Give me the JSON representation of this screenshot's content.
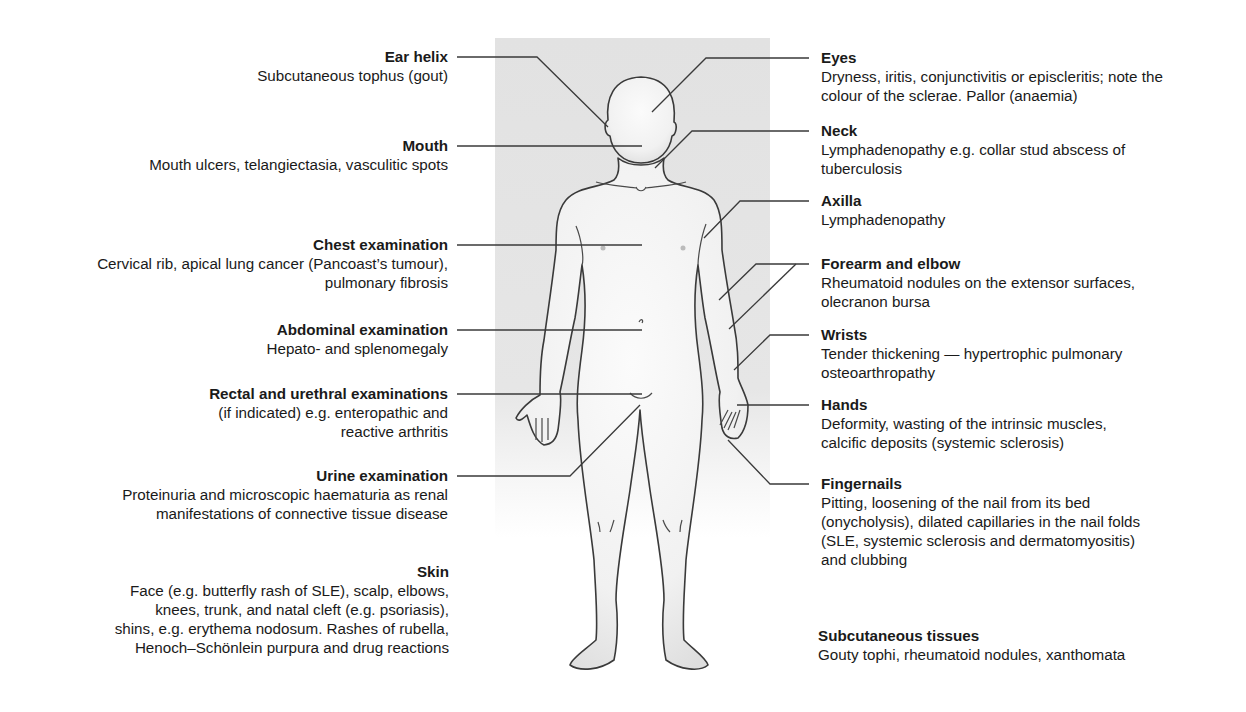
{
  "figure": {
    "background_panel_color": "#e4e4e4",
    "line_color": "#3a3a3a",
    "body_fill": "#f4f4f4"
  },
  "left_labels": [
    {
      "title": "Ear helix",
      "desc": "Subcutaneous tophus (gout)"
    },
    {
      "title": "Mouth",
      "desc": "Mouth ulcers, telangiectasia, vasculitic spots"
    },
    {
      "title": "Chest examination",
      "desc": "Cervical rib, apical lung cancer (Pancoast’s tumour),\npulmonary fibrosis"
    },
    {
      "title": "Abdominal examination",
      "desc": "Hepato- and splenomegaly"
    },
    {
      "title": "Rectal and urethral examinations",
      "desc": "(if indicated) e.g. enteropathic and\nreactive arthritis"
    },
    {
      "title": "Urine examination",
      "desc": "Proteinuria and microscopic haematuria as renal\nmanifestations of connective tissue disease"
    },
    {
      "title": "Skin",
      "desc": "Face (e.g. butterfly rash of SLE), scalp, elbows,\nknees, trunk, and natal cleft (e.g. psoriasis),\nshins, e.g. erythema nodosum. Rashes of rubella,\nHenoch–Schönlein purpura and drug reactions"
    }
  ],
  "right_labels": [
    {
      "title": "Eyes",
      "desc": "Dryness, iritis, conjunctivitis or episcleritis; note the\ncolour of the sclerae. Pallor (anaemia)"
    },
    {
      "title": "Neck",
      "desc": "Lymphadenopathy e.g. collar stud abscess of\ntuberculosis"
    },
    {
      "title": "Axilla",
      "desc": "Lymphadenopathy"
    },
    {
      "title": "Forearm and elbow",
      "desc": "Rheumatoid nodules on the extensor surfaces,\nolecranon bursa"
    },
    {
      "title": "Wrists",
      "desc": "Tender thickening — hypertrophic pulmonary\nosteoarthropathy"
    },
    {
      "title": "Hands",
      "desc": "Deformity, wasting of the intrinsic muscles,\ncalcific deposits (systemic sclerosis)"
    },
    {
      "title": "Fingernails",
      "desc": "Pitting, loosening of the nail from its bed\n(onycholysis), dilated capillaries in the nail folds\n(SLE, systemic sclerosis and dermatomyositis)\nand clubbing"
    },
    {
      "title": "Subcutaneous tissues",
      "desc": "Gouty tophi, rheumatoid nodules, xanthomata"
    }
  ]
}
